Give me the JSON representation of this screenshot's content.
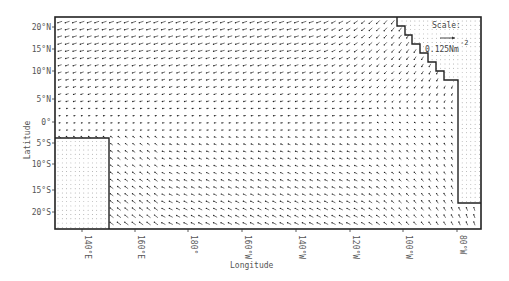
{
  "chart_data": {
    "type": "quiver",
    "title": "",
    "xlabel": "Longitude",
    "ylabel": "Latitude",
    "x_ticks": [
      "140°E",
      "160°E",
      "180°",
      "160°W",
      "140°W",
      "120°W",
      "100°W",
      "80°W"
    ],
    "y_ticks": [
      "20°N",
      "15°N",
      "10°N",
      "5°N",
      "0°",
      "5°S",
      "10°S",
      "15°S",
      "20°S"
    ],
    "xlim": [
      "130°E",
      "75°W"
    ],
    "ylim": [
      "22°S",
      "22°N"
    ],
    "grid": false,
    "legend": {
      "position": "top-right",
      "label": "Scale:",
      "reference_value": "0.125Nm",
      "reference_exponent": "-2"
    },
    "land_masks": [
      {
        "name": "Australia / New Guinea",
        "region": "southwest corner, ~130°E–153°E, 3°S–22°S"
      },
      {
        "name": "Central America",
        "region": "northeast corner, stepped coastline ~115°W–75°W, 9°N–22°N"
      },
      {
        "name": "South America",
        "region": "east edge, ~82°W–75°W, 5°N–18°S"
      }
    ]
  },
  "labels": {
    "x_ticks": [
      "140°E",
      "160°E",
      "180°",
      "160°W",
      "140°W",
      "120°W",
      "100°W",
      "80°W"
    ],
    "y_ticks": [
      "20°N",
      "15°N",
      "10°N",
      "5°N",
      "0°",
      "5°S",
      "10°S",
      "15°S",
      "20°S"
    ],
    "xlabel": "Longitude",
    "ylabel": "Latitude",
    "scale_title": "Scale:",
    "scale_value": "0.125Nm",
    "scale_exp": "-2"
  }
}
